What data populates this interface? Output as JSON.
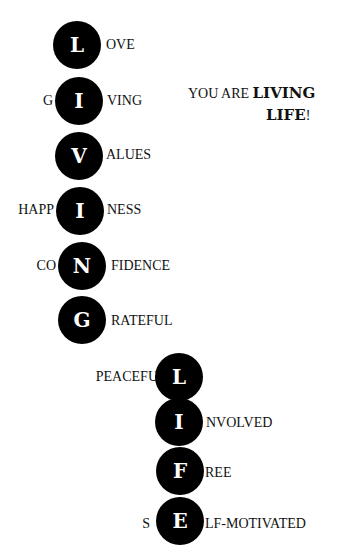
{
  "title": {
    "prefix": "YOU ARE ",
    "bold1": "LIVING",
    "bold2": "LIFE",
    "suffix": "!"
  },
  "living": [
    {
      "pre": "",
      "letter": "L",
      "post": "OVE"
    },
    {
      "pre": "G",
      "letter": "I",
      "post": "VING"
    },
    {
      "pre": "",
      "letter": "V",
      "post": "ALUES"
    },
    {
      "pre": "HAPP",
      "letter": "I",
      "post": "NESS"
    },
    {
      "pre": "CO",
      "letter": "N",
      "post": "FIDENCE"
    },
    {
      "pre": "",
      "letter": "G",
      "post": "RATEFUL"
    }
  ],
  "life": [
    {
      "pre": "PEACEFU",
      "letter": "L",
      "post": ""
    },
    {
      "pre": "",
      "letter": "I",
      "post": "NVOLVED"
    },
    {
      "pre": "",
      "letter": "F",
      "post": "REE"
    },
    {
      "pre": "S",
      "letter": "E",
      "post": "LF-MOTIVATED"
    }
  ]
}
